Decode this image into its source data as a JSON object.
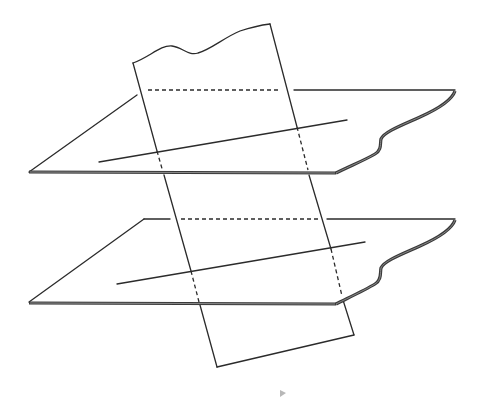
{
  "diagram": {
    "title": "",
    "colors": {
      "background": "#ffffff",
      "line": "#2b2b2b",
      "edge_shadow": "#3a3a3a",
      "marker": "#b8b8b8"
    },
    "elements": [
      {
        "id": "upper-plane",
        "label": ""
      },
      {
        "id": "lower-plane",
        "label": ""
      },
      {
        "id": "cutting-plane",
        "label": ""
      },
      {
        "id": "upper-line",
        "label": ""
      },
      {
        "id": "lower-line",
        "label": ""
      }
    ]
  }
}
